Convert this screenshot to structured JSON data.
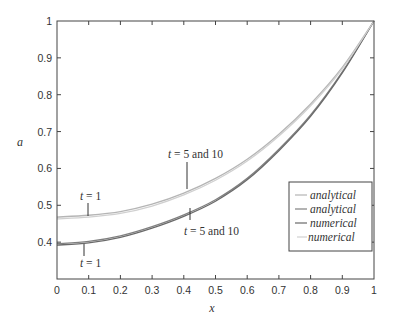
{
  "chart_data": {
    "type": "line",
    "title": "",
    "xlabel": "x",
    "ylabel": "a",
    "xlim": [
      0,
      1
    ],
    "ylim": [
      0.3,
      1
    ],
    "grid": false,
    "legend_position": "lower right",
    "x_ticks": [
      "0",
      "0.1",
      "0.2",
      "0.3",
      "0.4",
      "0.5",
      "0.6",
      "0.7",
      "0.8",
      "0.9",
      "1"
    ],
    "y_ticks": [
      "0.4",
      "0.5",
      "0.6",
      "0.7",
      "0.8",
      "0.9",
      "1"
    ],
    "x": [
      0,
      0.1,
      0.2,
      0.3,
      0.4,
      0.5,
      0.6,
      0.7,
      0.8,
      0.9,
      1.0
    ],
    "series": [
      {
        "name": "analytical",
        "color": "#b5b5b5",
        "values": [
          0.468,
          0.473,
          0.483,
          0.503,
          0.533,
          0.573,
          0.625,
          0.693,
          0.775,
          0.874,
          1.0
        ]
      },
      {
        "name": "analytical",
        "color": "#808080",
        "values": [
          0.396,
          0.402,
          0.417,
          0.442,
          0.474,
          0.515,
          0.573,
          0.652,
          0.745,
          0.862,
          1.0
        ]
      },
      {
        "name": "numerical",
        "color": "#6a6a6a",
        "values": [
          0.392,
          0.398,
          0.413,
          0.438,
          0.47,
          0.511,
          0.569,
          0.648,
          0.741,
          0.859,
          1.0
        ]
      },
      {
        "name": "numerical",
        "color": "#d0d0d0",
        "values": [
          0.463,
          0.468,
          0.478,
          0.498,
          0.528,
          0.568,
          0.62,
          0.688,
          0.77,
          0.87,
          1.0
        ]
      }
    ],
    "annotations": [
      {
        "text_var": "t",
        "text_rest": "= 1",
        "x": 0.1,
        "y": 0.47,
        "position": "above upper curve"
      },
      {
        "text_var": "t",
        "text_rest": "= 5 and 10",
        "x": 0.41,
        "y": 0.535,
        "position": "above upper curve"
      },
      {
        "text_var": "t",
        "text_rest": "= 1",
        "x": 0.08,
        "y": 0.4,
        "position": "below lower curve"
      },
      {
        "text_var": "t",
        "text_rest": "= 5 and 10",
        "x": 0.42,
        "y": 0.48,
        "position": "below lower curve"
      }
    ]
  },
  "labels": {
    "xlabel": "x",
    "ylabel": "a",
    "ann1_var": "t",
    "ann1_rest": " = 1",
    "ann2_var": "t",
    "ann2_rest": " = 5 and 10",
    "ann3_var": "t",
    "ann3_rest": " = 1",
    "ann4_var": "t",
    "ann4_rest": " = 5 and 10",
    "legend": [
      "analytical",
      "analytical",
      "numerical",
      "numerical"
    ]
  }
}
